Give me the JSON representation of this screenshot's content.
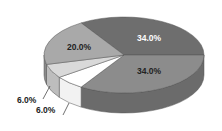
{
  "chart_data": {
    "type": "pie",
    "style": "3d",
    "title": "",
    "legend": "none",
    "slices": [
      {
        "label": "34.0%",
        "value": 34.0,
        "color": "#6e6e6e",
        "side": "#4f4f4f",
        "text_color": "#ffffff"
      },
      {
        "label": "34.0%",
        "value": 34.0,
        "color": "#8c8c8c",
        "side": "#6b6b6b",
        "text_color": "#222222"
      },
      {
        "label": "6.0%",
        "value": 6.0,
        "color": "#ffffff",
        "side": "#f2f2f2",
        "text_color": "#222222"
      },
      {
        "label": "6.0%",
        "value": 6.0,
        "color": "#d9d9d9",
        "side": "#bdbdbd",
        "text_color": "#222222"
      },
      {
        "label": "20.0%",
        "value": 20.0,
        "color": "#a9a9a9",
        "side": "#8a8a8a",
        "text_color": "#222222"
      }
    ]
  },
  "labels": {
    "dark_slice": "34.0%",
    "medium_slice": "34.0%",
    "white_slice": "6.0%",
    "light_slice": "6.0%",
    "left_slice": "20.0%"
  }
}
